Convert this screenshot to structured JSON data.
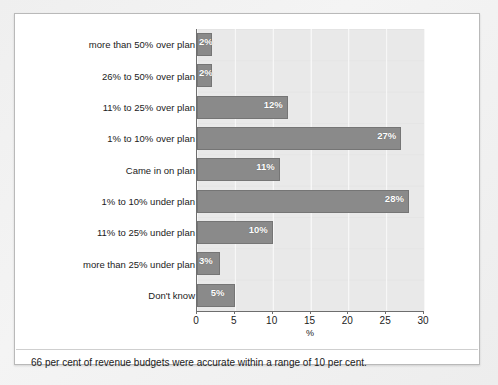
{
  "figure": {
    "caption": "66 per cent of revenue budgets were accurate within a range of 10 per cent.",
    "background_color": "#ffffff",
    "plot_background_color": "#e9e9e9",
    "bar_color": "#8a8a8a",
    "axis_color": "#6e6e6e",
    "text_color": "#1b1b1b",
    "value_label_color": "#ffffff"
  },
  "chart_data": {
    "type": "bar",
    "orientation": "horizontal",
    "title": "",
    "subtitle": "",
    "xlabel": "%",
    "ylabel": "",
    "xlim": [
      0,
      30
    ],
    "xticks": [
      0,
      5,
      10,
      15,
      20,
      25,
      30
    ],
    "xtick_labels": [
      "0",
      "5",
      "10",
      "15",
      "20",
      "25",
      "30"
    ],
    "grid": true,
    "grid_axis": "x",
    "legend": false,
    "legend_position": "none",
    "categories": [
      "more than 50% over plan",
      "26% to 50% over plan",
      "11% to 25% over plan",
      "1% to 10% over plan",
      "Came in on plan",
      "1% to 10% under plan",
      "11% to 25% under plan",
      "more than 25% under plan",
      "Don't know"
    ],
    "values": [
      2,
      2,
      12,
      27,
      11,
      28,
      10,
      3,
      5
    ],
    "value_labels": [
      "2%",
      "2%",
      "12%",
      "27%",
      "11%",
      "28%",
      "10%",
      "3%",
      "5%"
    ],
    "annotations": []
  }
}
